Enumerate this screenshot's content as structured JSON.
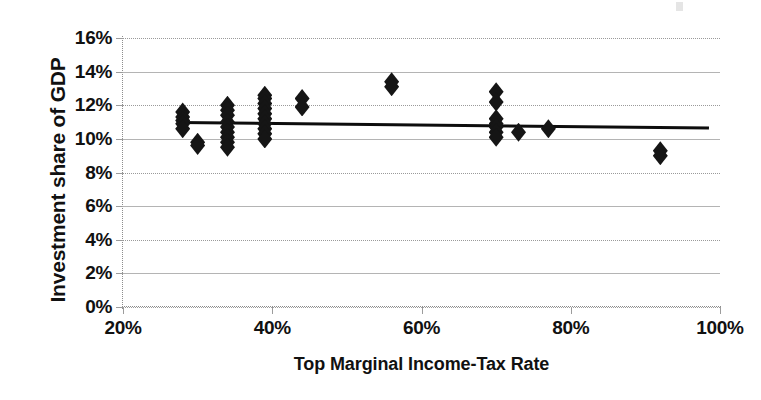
{
  "chart_data": {
    "type": "scatter",
    "title": "",
    "xlabel": "Top Marginal Income-Tax Rate",
    "ylabel": "Investment share of GDP",
    "xlim": [
      20,
      100
    ],
    "ylim": [
      0,
      16
    ],
    "x_ticks": [
      "20%",
      "40%",
      "60%",
      "80%",
      "100%"
    ],
    "x_tick_values": [
      20,
      40,
      60,
      80,
      100
    ],
    "y_ticks": [
      "0%",
      "2%",
      "4%",
      "6%",
      "8%",
      "10%",
      "12%",
      "14%",
      "16%"
    ],
    "y_tick_values": [
      0,
      2,
      4,
      6,
      8,
      10,
      12,
      14,
      16
    ],
    "grid": true,
    "legend": false,
    "marker_style": "diamond",
    "marker_color": "#151515",
    "points": [
      {
        "x": 28.0,
        "y": 11.6
      },
      {
        "x": 28.0,
        "y": 11.3
      },
      {
        "x": 28.0,
        "y": 11.1
      },
      {
        "x": 28.0,
        "y": 10.9
      },
      {
        "x": 28.0,
        "y": 10.6
      },
      {
        "x": 30.0,
        "y": 9.8
      },
      {
        "x": 30.0,
        "y": 9.6
      },
      {
        "x": 34.0,
        "y": 12.0
      },
      {
        "x": 34.0,
        "y": 11.7
      },
      {
        "x": 34.0,
        "y": 11.4
      },
      {
        "x": 34.0,
        "y": 11.0
      },
      {
        "x": 34.0,
        "y": 10.7
      },
      {
        "x": 34.0,
        "y": 10.4
      },
      {
        "x": 34.0,
        "y": 10.1
      },
      {
        "x": 34.0,
        "y": 9.8
      },
      {
        "x": 34.0,
        "y": 9.5
      },
      {
        "x": 39.0,
        "y": 12.6
      },
      {
        "x": 39.0,
        "y": 12.4
      },
      {
        "x": 39.0,
        "y": 12.1
      },
      {
        "x": 39.0,
        "y": 11.8
      },
      {
        "x": 39.0,
        "y": 11.5
      },
      {
        "x": 39.0,
        "y": 11.2
      },
      {
        "x": 39.0,
        "y": 10.9
      },
      {
        "x": 39.0,
        "y": 10.6
      },
      {
        "x": 39.0,
        "y": 10.3
      },
      {
        "x": 39.0,
        "y": 10.0
      },
      {
        "x": 44.0,
        "y": 12.4
      },
      {
        "x": 44.0,
        "y": 11.9
      },
      {
        "x": 56.0,
        "y": 13.4
      },
      {
        "x": 56.0,
        "y": 13.1
      },
      {
        "x": 70.0,
        "y": 12.8
      },
      {
        "x": 70.0,
        "y": 12.2
      },
      {
        "x": 70.0,
        "y": 11.2
      },
      {
        "x": 70.0,
        "y": 10.9
      },
      {
        "x": 70.0,
        "y": 10.7
      },
      {
        "x": 70.0,
        "y": 10.4
      },
      {
        "x": 70.0,
        "y": 10.1
      },
      {
        "x": 73.0,
        "y": 10.4
      },
      {
        "x": 77.0,
        "y": 10.6
      },
      {
        "x": 92.0,
        "y": 9.3
      },
      {
        "x": 92.0,
        "y": 9.0
      }
    ],
    "trendline": {
      "x_start": 27.5,
      "y_start": 11.05,
      "x_end": 98.5,
      "y_end": 10.72
    }
  }
}
